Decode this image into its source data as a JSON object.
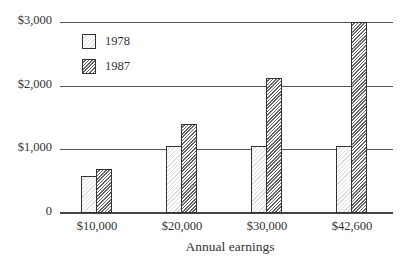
{
  "chart_data": {
    "type": "bar",
    "title": "",
    "xlabel": "Annual earnings",
    "ylabel": "",
    "categories": [
      "$10,000",
      "$20,000",
      "$30,000",
      "$42,600"
    ],
    "series": [
      {
        "name": "1978",
        "values": [
          580,
          1050,
          1050,
          1050
        ],
        "pattern": "light-hatch"
      },
      {
        "name": "1987",
        "values": [
          690,
          1400,
          2125,
          3000
        ],
        "pattern": "dark-hatch"
      }
    ],
    "ylim": [
      0,
      3000
    ],
    "yticks": [
      0,
      1000,
      2000,
      3000
    ],
    "ytick_labels": [
      "0",
      "$1,000",
      "$2,000",
      "$3,000"
    ],
    "grid": "horizontal",
    "legend": {
      "position": "upper-left",
      "entries": [
        "1978",
        "1987"
      ]
    }
  }
}
